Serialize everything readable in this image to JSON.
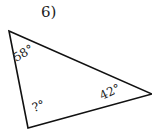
{
  "problem": {
    "number": "6)",
    "angles": {
      "top_left": "58°",
      "right": "42°",
      "bottom_left": "?°"
    }
  },
  "colors": {
    "stroke": "#111111",
    "text": "#222222"
  }
}
